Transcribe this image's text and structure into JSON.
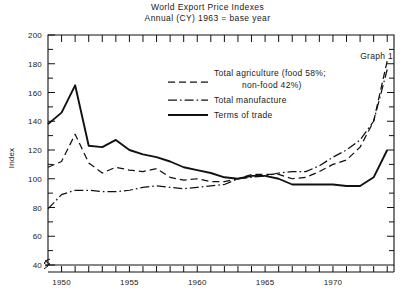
{
  "chart_data": {
    "type": "line",
    "title": "World Export Price Indexes",
    "subtitle": "Annual (CY) 1963 = base year",
    "annotation": "Graph 1",
    "xlabel": "",
    "ylabel": "Index",
    "xlim": [
      1949,
      1974.5
    ],
    "ylim": [
      33,
      200
    ],
    "y_axis_break_below": 40,
    "grid": false,
    "legend_position": "upper-center",
    "yticks": [
      40,
      60,
      80,
      100,
      120,
      140,
      160,
      180,
      200
    ],
    "ytick_labels": [
      "40",
      "60",
      "80",
      "100",
      "120",
      "140",
      "160",
      "180",
      "200"
    ],
    "y_minor_tick_step": 10,
    "xticks": [
      1950,
      1955,
      1960,
      1965,
      1970
    ],
    "xtick_labels": [
      "1950",
      "1955",
      "1960",
      "1965",
      "1970"
    ],
    "x_minor_tick_step": 1,
    "x": [
      1949,
      1950,
      1951,
      1952,
      1953,
      1954,
      1955,
      1956,
      1957,
      1958,
      1959,
      1960,
      1961,
      1962,
      1963,
      1964,
      1965,
      1966,
      1967,
      1968,
      1969,
      1970,
      1971,
      1972,
      1973,
      1974
    ],
    "series": [
      {
        "name": "Total agriculture (food 58%; non-food 42%)",
        "style": "dashed",
        "color": "#111111",
        "values": [
          108,
          112,
          131,
          111,
          104,
          108,
          106,
          105,
          107,
          101,
          99,
          100,
          98,
          98,
          100,
          103,
          103,
          103,
          100,
          101,
          105,
          110,
          113,
          122,
          140,
          182
        ]
      },
      {
        "name": "Total manufacture",
        "style": "dash-dot",
        "color": "#111111",
        "values": [
          79,
          89,
          92,
          92,
          91,
          91,
          92,
          94,
          95,
          94,
          93,
          94,
          95,
          96,
          100,
          101,
          102,
          104,
          105,
          105,
          109,
          115,
          120,
          127,
          140,
          176
        ]
      },
      {
        "name": "Terms of trade",
        "style": "solid",
        "color": "#111111",
        "values": [
          138,
          146,
          165,
          123,
          122,
          127,
          120,
          117,
          115,
          112,
          108,
          106,
          104,
          101,
          100,
          102,
          102,
          100,
          96,
          96,
          96,
          96,
          95,
          95,
          101,
          120
        ]
      }
    ]
  },
  "legend": {
    "items": [
      {
        "label_line1": "Total agriculture (food 58%;",
        "label_line2": "non-food 42%)",
        "style": "dashed"
      },
      {
        "label_line1": "Total manufacture",
        "label_line2": "",
        "style": "dash-dot"
      },
      {
        "label_line1": "Terms of trade",
        "label_line2": "",
        "style": "solid"
      }
    ]
  }
}
